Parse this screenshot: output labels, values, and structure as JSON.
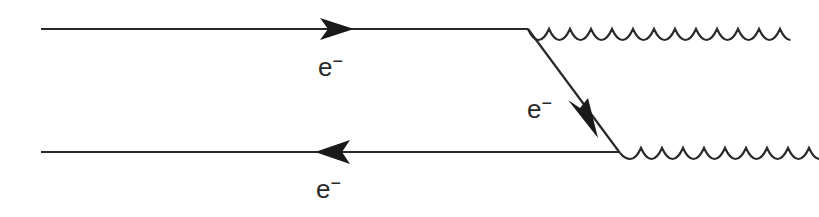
{
  "diagram": {
    "type": "feynman-diagram",
    "stroke_color": "#2a2a2a",
    "labels": {
      "top_electron": {
        "base": "e",
        "charge": "−"
      },
      "internal_electron": {
        "base": "e",
        "charge": "−"
      },
      "bottom_electron": {
        "base": "e",
        "charge": "−"
      }
    },
    "lines": [
      {
        "id": "top-electron-line",
        "kind": "fermion",
        "direction": "right"
      },
      {
        "id": "internal-electron-line",
        "kind": "fermion",
        "direction": "down-right"
      },
      {
        "id": "bottom-electron-line",
        "kind": "fermion",
        "direction": "left"
      },
      {
        "id": "top-photon",
        "kind": "photon"
      },
      {
        "id": "bottom-photon",
        "kind": "photon"
      }
    ]
  }
}
